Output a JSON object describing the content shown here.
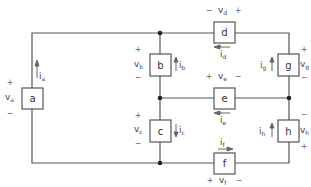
{
  "elements": [
    {
      "id": "a",
      "label": "a",
      "voltage": "v",
      "voltage_sub": "a",
      "current": "i",
      "current_sub": "a",
      "v_plus": "+",
      "v_minus": "−",
      "current_dir": "up"
    },
    {
      "id": "b",
      "label": "b",
      "voltage": "v",
      "voltage_sub": "b",
      "current": "i",
      "current_sub": "b",
      "v_plus": "+",
      "v_minus": "−",
      "current_dir": "up"
    },
    {
      "id": "c",
      "label": "c",
      "voltage": "v",
      "voltage_sub": "c",
      "current": "i",
      "current_sub": "c",
      "v_plus": "+",
      "v_minus": "−",
      "current_dir": "down"
    },
    {
      "id": "d",
      "label": "d",
      "voltage": "v",
      "voltage_sub": "d",
      "current": "i",
      "current_sub": "d",
      "v_plus": "+",
      "v_minus": "−",
      "current_dir": "left",
      "polarity": "minus-left"
    },
    {
      "id": "e",
      "label": "e",
      "voltage": "v",
      "voltage_sub": "e",
      "current": "i",
      "current_sub": "e",
      "v_plus": "+",
      "v_minus": "−",
      "current_dir": "left",
      "polarity": "plus-left"
    },
    {
      "id": "f",
      "label": "f",
      "voltage": "v",
      "voltage_sub": "f",
      "current": "i",
      "current_sub": "f",
      "v_plus": "+",
      "v_minus": "−",
      "current_dir": "right",
      "polarity": "plus-left"
    },
    {
      "id": "g",
      "label": "g",
      "voltage": "v",
      "voltage_sub": "g",
      "current": "i",
      "current_sub": "g",
      "v_plus": "+",
      "v_minus": "−",
      "current_dir": "up",
      "polarity": "plus-top"
    },
    {
      "id": "h",
      "label": "h",
      "voltage": "v",
      "voltage_sub": "h",
      "current": "i",
      "current_sub": "h",
      "v_plus": "+",
      "v_minus": "−",
      "current_dir": "up",
      "polarity": "minus-top"
    }
  ],
  "colors": {
    "wire": "#555555",
    "text": "#444444",
    "node": "#222222"
  }
}
